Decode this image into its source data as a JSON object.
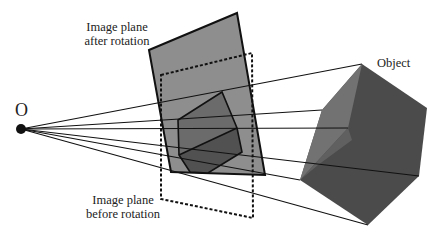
{
  "diagram": {
    "labels": {
      "origin": "O",
      "plane_after_line1": "Image plane",
      "plane_after_line2": "after rotation",
      "plane_before_line1": "Image plane",
      "plane_before_line2": "before rotation",
      "object": "Object"
    },
    "colors": {
      "plane_after_fill": "#8e8e8e",
      "projected_object_fill": "#6b6b6b",
      "projected_object_lower_fill": "#515151",
      "object_dark_fill": "#4b4b4b",
      "object_light_fill": "#727272",
      "lines": "#111111",
      "background": "#ffffff"
    },
    "elements": [
      "center of projection O",
      "image plane after rotation (solid outline, filled)",
      "image plane before rotation (dashed outline)",
      "projected object on image plane",
      "3D object (cube)",
      "projection rays from O to object vertices"
    ]
  }
}
